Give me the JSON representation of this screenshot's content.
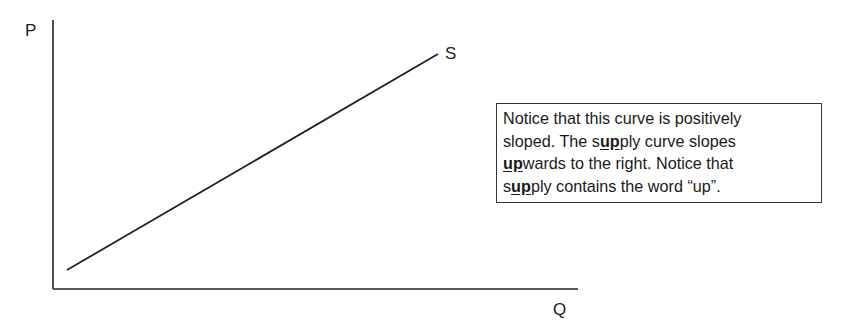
{
  "diagram": {
    "y_axis_label": "P",
    "x_axis_label": "Q",
    "curve_label": "S",
    "curve": {
      "name": "Supply",
      "start": [
        67,
        270
      ],
      "end": [
        438,
        54
      ],
      "slope": "positive"
    },
    "axes": {
      "origin": [
        53,
        289
      ],
      "y_top": 20,
      "x_right": 578
    },
    "line_color": "#222222"
  },
  "note": {
    "lines": [
      [
        {
          "t": "Notice that this curve is positively"
        }
      ],
      [
        {
          "t": "sloped. The s"
        },
        {
          "t": "up",
          "b": true
        },
        {
          "t": "ply curve slopes"
        }
      ],
      [
        {
          "t": "up",
          "b": true
        },
        {
          "t": "wards to the right. Notice that"
        }
      ],
      [
        {
          "t": "s"
        },
        {
          "t": "up",
          "b": true
        },
        {
          "t": "ply contains the word “up”."
        }
      ]
    ]
  }
}
